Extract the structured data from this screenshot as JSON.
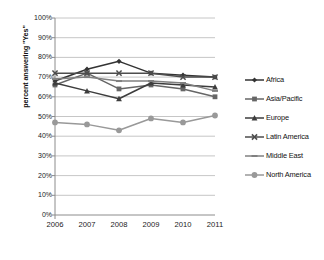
{
  "chart_data": {
    "type": "line",
    "title": "",
    "xlabel": "",
    "ylabel": "percent answering \"Yes\"",
    "categories": [
      "2006",
      "2007",
      "2008",
      "2009",
      "2010",
      "2011"
    ],
    "x": [
      2006,
      2007,
      2008,
      2009,
      2010,
      2011
    ],
    "ylim": [
      0,
      100
    ],
    "ytick_labels": [
      "0%",
      "10%",
      "20%",
      "30%",
      "40%",
      "50%",
      "60%",
      "70%",
      "80%",
      "90%",
      "100%"
    ],
    "ytick_values": [
      0,
      10,
      20,
      30,
      40,
      50,
      60,
      70,
      80,
      90,
      100
    ],
    "grid": "horizontal",
    "legend_position": "right",
    "series": [
      {
        "name": "Africa",
        "marker": "diamond",
        "color": "#333333",
        "values": [
          68,
          74,
          78,
          72,
          71,
          70
        ]
      },
      {
        "name": "Asia/Pacific",
        "marker": "square",
        "color": "#666666",
        "values": [
          66,
          72,
          64,
          66,
          64,
          60
        ]
      },
      {
        "name": "Europe",
        "marker": "triangle",
        "color": "#3d3d3d",
        "values": [
          67,
          63,
          59,
          67,
          66,
          65
        ]
      },
      {
        "name": "Latin America",
        "marker": "cross",
        "color": "#4d4d4d",
        "values": [
          72,
          72,
          72,
          72,
          70,
          70
        ]
      },
      {
        "name": "Middle East",
        "marker": "dash",
        "color": "#808080",
        "values": [
          69,
          70,
          68,
          68,
          67,
          63
        ]
      },
      {
        "name": "North America",
        "marker": "circle",
        "color": "#999999",
        "values": [
          47,
          46,
          43,
          49,
          47,
          50.5
        ]
      }
    ]
  },
  "axes": {
    "y_title": "percent answering \"Yes\""
  },
  "legend": {
    "entries": [
      {
        "label": "Africa"
      },
      {
        "label": "Asia/Pacific"
      },
      {
        "label": "Europe"
      },
      {
        "label": "Latin America"
      },
      {
        "label": "Middle East"
      },
      {
        "label": "North America"
      }
    ]
  },
  "style": {
    "background": "#ffffff",
    "grid_color": "#b8b8b8",
    "axis_color": "#8c8c8c",
    "text_color": "#1a1a1a"
  }
}
